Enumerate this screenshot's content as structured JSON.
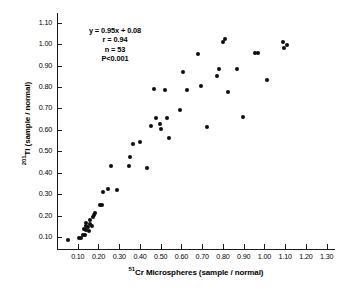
{
  "chart_data": {
    "type": "scatter",
    "title": "",
    "xlabel": "51Cr Microspheres (sample / normal)",
    "ylabel": "201Tl (sample / normal)",
    "xlabel_sup": "51",
    "xlabel_base": "Cr Microspheres (sample / normal)",
    "ylabel_sup": "201",
    "ylabel_base": "Tl (sample / normal)",
    "xlim": [
      0.0,
      1.34
    ],
    "ylim": [
      0.045,
      1.145
    ],
    "grid": false,
    "legend": "none",
    "xticks": [
      0.1,
      0.2,
      0.3,
      0.4,
      0.5,
      0.6,
      0.7,
      0.8,
      0.9,
      1.0,
      1.1,
      1.2,
      1.3
    ],
    "xticklabels": [
      "0.10",
      "0.20",
      "0.30",
      "0.40",
      "0.50",
      "0.60",
      "0.70",
      "0.80",
      "0.90",
      "1.00",
      "1.10",
      "1.20",
      "1.30"
    ],
    "yticks": [
      0.1,
      0.2,
      0.3,
      0.4,
      0.5,
      0.6,
      0.7,
      0.8,
      0.9,
      1.0,
      1.1
    ],
    "yticklabels": [
      "0.10",
      "0.20",
      "0.30",
      "0.40",
      "0.50",
      "0.60",
      "0.70",
      "0.80",
      "0.90",
      "1.00",
      "1.10"
    ],
    "n_points": 53,
    "points": [
      [
        0.055,
        0.085
      ],
      [
        0.105,
        0.095
      ],
      [
        0.115,
        0.098
      ],
      [
        0.125,
        0.112
      ],
      [
        0.135,
        0.108
      ],
      [
        0.128,
        0.138
      ],
      [
        0.138,
        0.132
      ],
      [
        0.142,
        0.152
      ],
      [
        0.14,
        0.165
      ],
      [
        0.15,
        0.148
      ],
      [
        0.152,
        0.128
      ],
      [
        0.158,
        0.16
      ],
      [
        0.16,
        0.178
      ],
      [
        0.168,
        0.152
      ],
      [
        0.172,
        0.192
      ],
      [
        0.178,
        0.205
      ],
      [
        0.185,
        0.215
      ],
      [
        0.205,
        0.252
      ],
      [
        0.215,
        0.252
      ],
      [
        0.222,
        0.312
      ],
      [
        0.248,
        0.325
      ],
      [
        0.288,
        0.318
      ],
      [
        0.262,
        0.43
      ],
      [
        0.348,
        0.432
      ],
      [
        0.352,
        0.475
      ],
      [
        0.368,
        0.535
      ],
      [
        0.398,
        0.542
      ],
      [
        0.432,
        0.422
      ],
      [
        0.452,
        0.618
      ],
      [
        0.468,
        0.79
      ],
      [
        0.478,
        0.655
      ],
      [
        0.498,
        0.628
      ],
      [
        0.502,
        0.602
      ],
      [
        0.522,
        0.785
      ],
      [
        0.528,
        0.655
      ],
      [
        0.542,
        0.562
      ],
      [
        0.592,
        0.692
      ],
      [
        0.608,
        0.872
      ],
      [
        0.625,
        0.785
      ],
      [
        0.678,
        0.952
      ],
      [
        0.692,
        0.805
      ],
      [
        0.722,
        0.612
      ],
      [
        0.772,
        0.852
      ],
      [
        0.782,
        0.882
      ],
      [
        0.802,
        1.012
      ],
      [
        0.812,
        1.022
      ],
      [
        0.825,
        0.775
      ],
      [
        0.868,
        0.882
      ],
      [
        0.895,
        0.658
      ],
      [
        0.952,
        0.958
      ],
      [
        0.968,
        0.958
      ],
      [
        1.012,
        0.832
      ],
      [
        1.088,
        1.008
      ],
      [
        1.095,
        0.982
      ],
      [
        1.108,
        0.998
      ]
    ],
    "annotations": {
      "equation": "y = 0.95x + 0.08",
      "r": "r = 0.94",
      "n": "n = 53",
      "p": "P<0.001"
    }
  }
}
